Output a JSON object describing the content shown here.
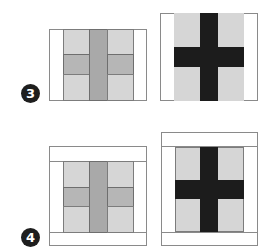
{
  "steps": [
    {
      "number": "3",
      "description": "Block with side borders added"
    },
    {
      "number": "4",
      "description": "Block with top and bottom borders added"
    }
  ],
  "blocks": {
    "step3_left": {
      "type": "plus-sashed block",
      "style": "gray"
    },
    "step3_right": {
      "type": "cross block",
      "style": "dark cross"
    },
    "step4_left": {
      "type": "plus-sashed block",
      "style": "gray"
    },
    "step4_right": {
      "type": "cross block",
      "style": "dark cross"
    }
  },
  "colors": {
    "light_panel": "#d6d6d6",
    "medium_bar": "#b6b6b6",
    "center_strip": "#a9a9a9",
    "dark_cross": "#1c1c1c",
    "border": "#ffffff",
    "badge": "#1e1e1e"
  }
}
